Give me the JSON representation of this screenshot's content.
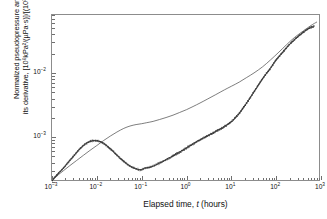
{
  "chart_data": {
    "type": "line",
    "title": "",
    "xlabel": "Elapsed time, t (hours)",
    "xlabel_parts": {
      "prefix": "Elapsed time, ",
      "italic": "t",
      "suffix": " (hours)"
    },
    "ylabel_line1": "Normalized pseudopressure and",
    "ylabel_line2": "its derivative, [10⁶kPa²/(µPa·s)]/[(10³m³/d)]",
    "xscale": "log",
    "yscale": "log",
    "xlim": [
      0.001,
      1000
    ],
    "ylim": [
      0.0002,
      0.08
    ],
    "grid": false,
    "legend": "none",
    "xticks": [
      {
        "value": 0.001,
        "label": "10⁻³",
        "exp": "-3"
      },
      {
        "value": 0.01,
        "label": "10⁻²",
        "exp": "-2"
      },
      {
        "value": 0.1,
        "label": "10⁻¹",
        "exp": "-1"
      },
      {
        "value": 1,
        "label": "10⁰",
        "exp": "0"
      },
      {
        "value": 10,
        "label": "10¹",
        "exp": "1"
      },
      {
        "value": 100,
        "label": "10²",
        "exp": "2"
      },
      {
        "value": 1000,
        "label": "10³",
        "exp": "3"
      }
    ],
    "yticks": [
      {
        "value": 0.01,
        "label": "10⁻²",
        "exp": "-2"
      },
      {
        "value": 0.001,
        "label": "10⁻³",
        "exp": "-3"
      }
    ],
    "series": [
      {
        "name": "Normalized pseudopressure",
        "style": "solid-thin",
        "color": "#555555",
        "x": [
          0.001,
          0.0013,
          0.0018,
          0.0025,
          0.0035,
          0.005,
          0.007,
          0.01,
          0.014,
          0.02,
          0.028,
          0.04,
          0.055,
          0.075,
          0.1,
          0.13,
          0.18,
          0.25,
          0.35,
          0.5,
          0.7,
          1.0,
          1.4,
          2.0,
          3.0,
          4.5,
          7.0,
          10,
          15,
          22,
          32,
          50,
          75,
          110,
          170,
          260,
          400,
          600,
          800
        ],
        "y": [
          0.00021,
          0.00025,
          0.0003,
          0.00036,
          0.00043,
          0.00052,
          0.00062,
          0.00074,
          0.00088,
          0.00104,
          0.0012,
          0.00137,
          0.00149,
          0.00157,
          0.00162,
          0.00168,
          0.00176,
          0.00188,
          0.00202,
          0.0022,
          0.00242,
          0.00268,
          0.003,
          0.0034,
          0.00395,
          0.0046,
          0.00545,
          0.0062,
          0.0072,
          0.0085,
          0.01,
          0.0125,
          0.016,
          0.0205,
          0.0275,
          0.036,
          0.045,
          0.055,
          0.062
        ]
      },
      {
        "name": "Pseudopressure derivative",
        "style": "dotted-scatter",
        "color": "#333333",
        "x": [
          0.001,
          0.0013,
          0.0018,
          0.0024,
          0.0032,
          0.0042,
          0.0055,
          0.0068,
          0.0082,
          0.01,
          0.012,
          0.015,
          0.018,
          0.022,
          0.027,
          0.033,
          0.04,
          0.05,
          0.062,
          0.077,
          0.095,
          0.12,
          0.15,
          0.19,
          0.24,
          0.3,
          0.38,
          0.48,
          0.6,
          0.78,
          1.0,
          1.3,
          1.7,
          2.2,
          2.9,
          3.8,
          5.0,
          6.5,
          8.5,
          11,
          15,
          20,
          28,
          38,
          52,
          72,
          100,
          140,
          200,
          280,
          400,
          550,
          700
        ],
        "y": [
          0.00021,
          0.00026,
          0.00033,
          0.00042,
          0.00053,
          0.00066,
          0.00078,
          0.00085,
          0.00088,
          0.00088,
          0.00085,
          0.00078,
          0.0007,
          0.00062,
          0.00054,
          0.00047,
          0.00042,
          0.00037,
          0.00034,
          0.00032,
          0.00031,
          0.00033,
          0.00034,
          0.00036,
          0.00039,
          0.00042,
          0.00046,
          0.0005,
          0.00055,
          0.00061,
          0.00068,
          0.00076,
          0.00085,
          0.00094,
          0.00104,
          0.00115,
          0.00128,
          0.00142,
          0.0016,
          0.00185,
          0.00235,
          0.0031,
          0.0044,
          0.0061,
          0.0085,
          0.0115,
          0.016,
          0.021,
          0.028,
          0.035,
          0.043,
          0.05,
          0.054
        ]
      }
    ]
  }
}
